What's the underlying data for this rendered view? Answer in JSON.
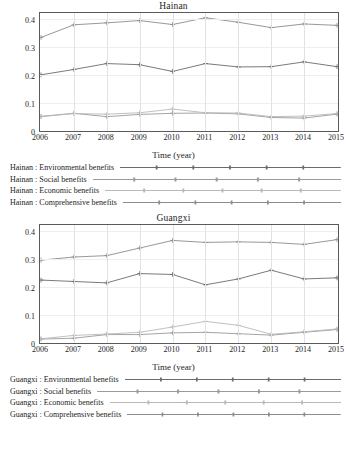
{
  "figure": {
    "axis_title": "Time (year)",
    "y_ticks": [
      "0.4",
      "0.3",
      "0.2",
      "0.1",
      "0"
    ],
    "x_ticks": [
      "2006",
      "2007",
      "2008",
      "2009",
      "2010",
      "2011",
      "2012",
      "2013",
      "2014",
      "2015"
    ]
  },
  "chart_data": [
    {
      "type": "line",
      "title": "Hainan",
      "xlabel": "Time (year)",
      "ylabel": "",
      "x": [
        2006,
        2007,
        2008,
        2009,
        2010,
        2011,
        2012,
        2013,
        2014,
        2015
      ],
      "xlim": [
        2006,
        2015
      ],
      "ylim": [
        0,
        0.42
      ],
      "yticks": [
        0,
        0.1,
        0.2,
        0.3,
        0.4
      ],
      "grid": true,
      "legend_position": "below",
      "series": [
        {
          "name": "Hainan : Environmental benefits",
          "color": "#6b6b6b",
          "values": [
            0.2,
            0.219,
            0.24,
            0.236,
            0.212,
            0.24,
            0.228,
            0.229,
            0.246,
            0.229
          ]
        },
        {
          "name": "Hainan : Social benefits",
          "color": "#9a9a9a",
          "values": [
            0.052,
            0.063,
            0.051,
            0.059,
            0.063,
            0.064,
            0.061,
            0.048,
            0.046,
            0.06
          ]
        },
        {
          "name": "Hainan : Economic benefits",
          "color": "#b9b9b9",
          "values": [
            0.051,
            0.062,
            0.06,
            0.065,
            0.078,
            0.065,
            0.064,
            0.051,
            0.053,
            0.062
          ]
        },
        {
          "name": "Hainan : Comprehensive benefits",
          "color": "#8c8c8c",
          "values": [
            0.333,
            0.378,
            0.385,
            0.393,
            0.379,
            0.403,
            0.387,
            0.368,
            0.381,
            0.376
          ]
        }
      ]
    },
    {
      "type": "line",
      "title": "Guangxi",
      "xlabel": "Time (year)",
      "ylabel": "",
      "x": [
        2006,
        2007,
        2008,
        2009,
        2010,
        2011,
        2012,
        2013,
        2014,
        2015
      ],
      "xlim": [
        2006,
        2015
      ],
      "ylim": [
        0,
        0.42
      ],
      "yticks": [
        0,
        0.1,
        0.2,
        0.3,
        0.4
      ],
      "grid": true,
      "legend_position": "below",
      "series": [
        {
          "name": "Guangxi : Environmental benefits",
          "color": "#6b6b6b",
          "values": [
            0.224,
            0.219,
            0.214,
            0.247,
            0.244,
            0.207,
            0.228,
            0.259,
            0.228,
            0.232
          ]
        },
        {
          "name": "Guangxi : Social benefits",
          "color": "#9a9a9a",
          "values": [
            0.014,
            0.017,
            0.03,
            0.03,
            0.036,
            0.038,
            0.033,
            0.028,
            0.038,
            0.048
          ]
        },
        {
          "name": "Guangxi : Economic benefits",
          "color": "#b9b9b9",
          "values": [
            0.015,
            0.027,
            0.032,
            0.038,
            0.057,
            0.077,
            0.063,
            0.031,
            0.04,
            0.05
          ]
        },
        {
          "name": "Guangxi : Comprehensive benefits",
          "color": "#8c8c8c",
          "values": [
            0.295,
            0.306,
            0.311,
            0.338,
            0.365,
            0.358,
            0.36,
            0.358,
            0.351,
            0.368
          ]
        }
      ]
    }
  ]
}
